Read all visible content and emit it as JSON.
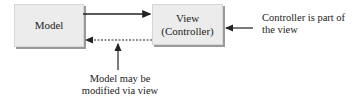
{
  "diagram": {
    "nodes": [
      {
        "id": "model",
        "label": "Model"
      },
      {
        "id": "view",
        "label_line1": "View",
        "label_line2": "(Controller)"
      }
    ],
    "annotations": {
      "controller_note_line1": "Controller is part of",
      "controller_note_line2": "the view",
      "model_note_line1": "Model may be",
      "model_note_line2": "modified via view"
    },
    "edges": [
      {
        "from": "model",
        "to": "view",
        "style": "solid"
      },
      {
        "from": "view",
        "to": "model",
        "style": "dashed"
      }
    ],
    "colors": {
      "box_fill": "#ececec",
      "box_shadow": "#9a9a9a",
      "line": "#222222"
    }
  }
}
